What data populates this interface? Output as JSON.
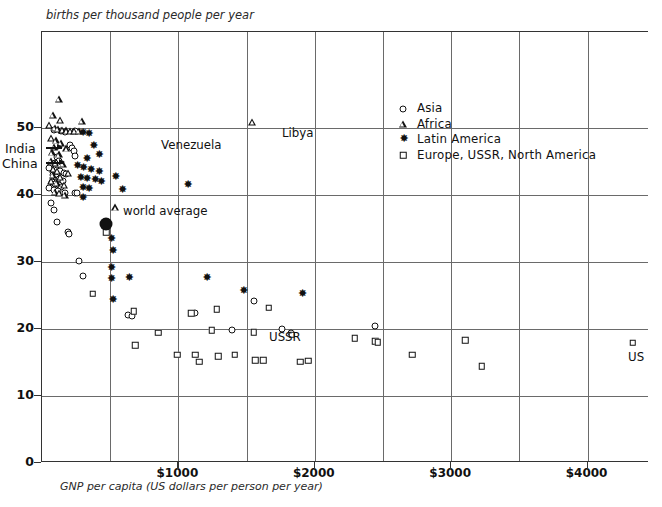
{
  "cut_top_text": "(partially cropped heading line)",
  "axes": {
    "y_title": "births per thousand people per year",
    "x_title": "GNP per capita (US dollars per person per year)",
    "y_ticks": [
      "0",
      "10",
      "20",
      "30",
      "40",
      "50"
    ],
    "x_ticks": [
      "$1000",
      "$2000",
      "$3000",
      "$4000"
    ]
  },
  "legend": {
    "items": [
      {
        "label": "Asia",
        "symbol": "circle-open"
      },
      {
        "label": "Africa",
        "symbol": "triangle-open"
      },
      {
        "label": "Latin America",
        "symbol": "star-filled"
      },
      {
        "label": "Europe, USSR, North America",
        "symbol": "square-open"
      }
    ]
  },
  "annotations": [
    {
      "text": "India",
      "kind": "left-arrow"
    },
    {
      "text": "China",
      "kind": "left-arrow"
    },
    {
      "text": "world average",
      "kind": "inline"
    },
    {
      "text": "Venezuela",
      "kind": "inline"
    },
    {
      "text": "Libya",
      "kind": "inline"
    },
    {
      "text": "USSR",
      "kind": "inline"
    },
    {
      "text": "US",
      "kind": "inline"
    }
  ],
  "chart_data": {
    "type": "scatter",
    "title": "",
    "xlabel": "GNP per capita (US dollars per person per year)",
    "ylabel": "births per thousand people per year",
    "xlim": [
      0,
      4450
    ],
    "ylim": [
      0,
      57
    ],
    "x_ticks": [
      1000,
      2000,
      3000,
      4000
    ],
    "x_minor_ticks": [
      500,
      1500,
      2500,
      3500,
      4000
    ],
    "y_ticks": [
      0,
      10,
      20,
      30,
      40,
      50
    ],
    "grid": "vertical every $500, horizontal at 10,20,30,40,50",
    "legend_position": "upper-right inside plot",
    "series": [
      {
        "name": "Asia",
        "symbol": "circle-open",
        "points": [
          [
            95,
            49.5
          ],
          [
            150,
            49.4
          ],
          [
            175,
            49.3
          ],
          [
            250,
            49.4
          ],
          [
            210,
            47.3
          ],
          [
            225,
            46.8
          ],
          [
            240,
            46.4
          ],
          [
            250,
            45.6
          ],
          [
            120,
            45.5
          ],
          [
            130,
            45.0
          ],
          [
            100,
            44.6
          ],
          [
            70,
            44.3
          ],
          [
            60,
            43.9
          ],
          [
            115,
            43.6
          ],
          [
            140,
            43.4
          ],
          [
            165,
            43.2
          ],
          [
            185,
            43.0
          ],
          [
            90,
            42.8
          ],
          [
            110,
            42.5
          ],
          [
            135,
            42.2
          ],
          [
            160,
            42.0
          ],
          [
            80,
            41.8
          ],
          [
            105,
            41.5
          ],
          [
            130,
            41.3
          ],
          [
            150,
            41.1
          ],
          [
            60,
            40.9
          ],
          [
            95,
            40.6
          ],
          [
            125,
            40.4
          ],
          [
            175,
            40.2
          ],
          [
            250,
            40.1
          ],
          [
            265,
            40.1
          ],
          [
            75,
            38.6
          ],
          [
            95,
            37.6
          ],
          [
            120,
            35.8
          ],
          [
            195,
            34.3
          ],
          [
            205,
            34.0
          ],
          [
            275,
            30.0
          ],
          [
            310,
            27.7
          ],
          [
            640,
            22.0
          ],
          [
            665,
            21.8
          ],
          [
            1130,
            22.2
          ],
          [
            1560,
            24.0
          ],
          [
            1400,
            19.7
          ],
          [
            1770,
            19.8
          ],
          [
            1830,
            19.2
          ],
          [
            2450,
            20.3
          ]
        ]
      },
      {
        "name": "Africa",
        "symbol": "triangle-open",
        "points": [
          [
            130,
            54.2
          ],
          [
            85,
            51.8
          ],
          [
            140,
            51.0
          ],
          [
            300,
            50.9
          ],
          [
            60,
            50.3
          ],
          [
            100,
            49.9
          ],
          [
            125,
            49.7
          ],
          [
            155,
            49.6
          ],
          [
            185,
            49.5
          ],
          [
            215,
            49.4
          ],
          [
            245,
            49.4
          ],
          [
            275,
            49.4
          ],
          [
            75,
            48.4
          ],
          [
            110,
            48.0
          ],
          [
            145,
            47.6
          ],
          [
            95,
            47.0
          ],
          [
            185,
            46.8
          ],
          [
            80,
            46.2
          ],
          [
            130,
            45.9
          ],
          [
            70,
            45.0
          ],
          [
            105,
            44.6
          ],
          [
            160,
            44.5
          ],
          [
            90,
            43.8
          ],
          [
            120,
            43.5
          ],
          [
            200,
            43.2
          ],
          [
            85,
            42.8
          ],
          [
            140,
            42.6
          ],
          [
            75,
            41.9
          ],
          [
            115,
            41.6
          ],
          [
            170,
            41.4
          ],
          [
            100,
            40.3
          ],
          [
            135,
            40.2
          ],
          [
            175,
            39.9
          ],
          [
            545,
            38.0
          ],
          [
            1550,
            50.7
          ]
        ]
      },
      {
        "name": "Latin America",
        "symbol": "star-filled",
        "points": [
          [
            300,
            48.9
          ],
          [
            345,
            48.8
          ],
          [
            380,
            47.0
          ],
          [
            420,
            45.6
          ],
          [
            330,
            45.1
          ],
          [
            260,
            44.1
          ],
          [
            305,
            43.7
          ],
          [
            360,
            43.4
          ],
          [
            420,
            43.2
          ],
          [
            285,
            42.3
          ],
          [
            330,
            42.1
          ],
          [
            390,
            41.9
          ],
          [
            435,
            41.7
          ],
          [
            300,
            40.8
          ],
          [
            345,
            40.6
          ],
          [
            300,
            39.3
          ],
          [
            540,
            42.4
          ],
          [
            590,
            40.4
          ],
          [
            1070,
            41.2
          ],
          [
            510,
            33.2
          ],
          [
            520,
            31.3
          ],
          [
            510,
            28.8
          ],
          [
            510,
            27.2
          ],
          [
            640,
            27.3
          ],
          [
            1210,
            27.3
          ],
          [
            520,
            24.0
          ],
          [
            1480,
            25.3
          ],
          [
            1910,
            24.9
          ]
        ]
      },
      {
        "name": "Europe, USSR, North America",
        "symbol": "square-open",
        "points": [
          [
            480,
            34.3
          ],
          [
            380,
            25.1
          ],
          [
            680,
            22.5
          ],
          [
            1100,
            22.2
          ],
          [
            860,
            19.3
          ],
          [
            1290,
            22.8
          ],
          [
            1670,
            23.0
          ],
          [
            1250,
            19.7
          ],
          [
            1560,
            19.4
          ],
          [
            1840,
            19.0
          ],
          [
            2300,
            18.5
          ],
          [
            2450,
            18.0
          ],
          [
            2470,
            17.9
          ],
          [
            3110,
            18.2
          ],
          [
            690,
            17.4
          ],
          [
            1000,
            16.0
          ],
          [
            1130,
            16.0
          ],
          [
            1300,
            15.8
          ],
          [
            1160,
            15.0
          ],
          [
            1420,
            16.0
          ],
          [
            1570,
            15.2
          ],
          [
            1630,
            15.2
          ],
          [
            1900,
            15.0
          ],
          [
            1960,
            15.1
          ],
          [
            2720,
            16.0
          ],
          [
            3230,
            14.3
          ],
          [
            4340,
            17.8
          ]
        ]
      },
      {
        "name": "world average",
        "symbol": "circle-filled-large",
        "points": [
          [
            480,
            35.5
          ]
        ]
      }
    ],
    "labeled_points": [
      {
        "label": "India",
        "series": "Asia"
      },
      {
        "label": "China",
        "series": "Asia"
      },
      {
        "label": "Venezuela",
        "series": "Latin America",
        "x": 1070,
        "y": 41.2
      },
      {
        "label": "Libya",
        "series": "Africa",
        "x": 1550,
        "y": 50.7
      },
      {
        "label": "USSR",
        "series": "Europe, USSR, North America"
      },
      {
        "label": "US",
        "series": "Europe, USSR, North America",
        "x": 4340,
        "y": 17.8
      },
      {
        "label": "world average",
        "series": "world average",
        "x": 480,
        "y": 35.5
      }
    ]
  }
}
